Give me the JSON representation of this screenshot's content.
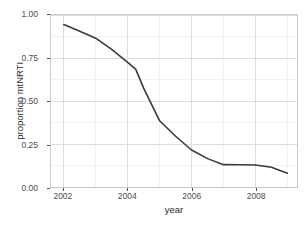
{
  "chart_data": {
    "type": "line",
    "title": "",
    "xlabel": "year",
    "ylabel": "proportion mtNRTI",
    "xlim": [
      2001.6,
      2009.3
    ],
    "ylim": [
      0.0,
      1.0
    ],
    "grid": true,
    "legend": false,
    "x_ticks": [
      2002,
      2004,
      2006,
      2008
    ],
    "x_tick_labels": [
      "2002",
      "2004",
      "2006",
      "2008"
    ],
    "x_minor_ticks": [
      2003,
      2005,
      2007,
      2009
    ],
    "y_ticks": [
      0.0,
      0.25,
      0.5,
      0.75,
      1.0
    ],
    "y_tick_labels": [
      "0.00",
      "0.25",
      "0.50",
      "0.75",
      "1.00"
    ],
    "y_minor_ticks": [
      0.125,
      0.375,
      0.625,
      0.875
    ],
    "line_color": "#3a3a3a",
    "line_width": 1.6,
    "panel_background": "#ffffff",
    "grid_color": "#d9d9d9",
    "border_color": "#c9c9c9",
    "series": [
      {
        "name": "proportion mtNRTI",
        "x": [
          2002.0,
          2002.5,
          2003.0,
          2003.5,
          2004.0,
          2004.25,
          2004.5,
          2005.0,
          2005.5,
          2006.0,
          2006.5,
          2007.0,
          2007.5,
          2008.0,
          2008.5,
          2009.0
        ],
        "values": [
          0.945,
          0.905,
          0.865,
          0.8,
          0.725,
          0.685,
          0.575,
          0.385,
          0.295,
          0.215,
          0.165,
          0.13,
          0.129,
          0.128,
          0.115,
          0.08
        ]
      }
    ]
  },
  "axes": {
    "y_title": "proportion mtNRTI",
    "x_title": "year"
  }
}
